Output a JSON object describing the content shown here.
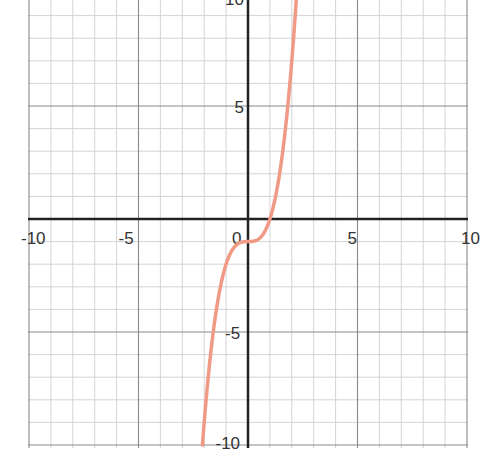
{
  "chart_data": {
    "type": "line",
    "title": "",
    "xlabel": "",
    "ylabel": "",
    "xlim": [
      -10,
      10
    ],
    "ylim": [
      -10,
      10
    ],
    "grid": true,
    "minor_grid_step": 1,
    "major_grid_step": 5,
    "x_tick_labels": [
      "-10",
      "-5",
      "0",
      "5",
      "10"
    ],
    "y_tick_labels": [
      "10",
      "5",
      "-5",
      "-10"
    ],
    "series": [
      {
        "name": "f(x) = x^3 - 1",
        "color": "#f09a85",
        "x": [
          -2.08,
          -2,
          -1.5,
          -1,
          -0.5,
          0,
          0.5,
          1,
          1.5,
          2,
          2.22
        ],
        "y": [
          -10,
          -9,
          -4.375,
          -2,
          -1.125,
          -1,
          -0.875,
          0,
          2.375,
          7,
          10
        ]
      }
    ],
    "colors": {
      "axis": "#222222",
      "major_grid": "#8a8a8a",
      "minor_grid": "#cfcfcf",
      "curve": "#f09a85"
    }
  }
}
